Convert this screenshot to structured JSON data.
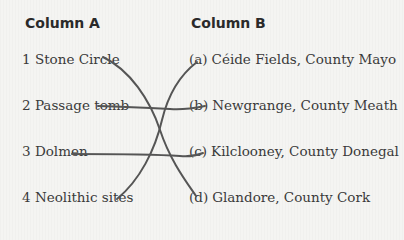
{
  "columns": {
    "a": {
      "heading": "Column A",
      "items": [
        {
          "label": "1 Stone Circle"
        },
        {
          "label": "2 Passage tomb"
        },
        {
          "label": "3 Dolmen"
        },
        {
          "label": "4 Neolithic sites"
        }
      ]
    },
    "b": {
      "heading": "Column B",
      "items": [
        {
          "letter": "(a)",
          "text": "Céide Fields, County Mayo"
        },
        {
          "letter": "(b)",
          "text": "Newgrange, County Meath"
        },
        {
          "letter": "(c)",
          "text": "Kilclooney, County Donegal"
        },
        {
          "letter": "(d)",
          "text": "Glandore, County Cork"
        }
      ]
    }
  },
  "matches": [
    {
      "from": "1 Stone Circle",
      "to": "(d)"
    },
    {
      "from": "2 Passage tomb",
      "to": "(b)"
    },
    {
      "from": "3 Dolmen",
      "to": "(c)"
    },
    {
      "from": "4 Neolithic sites",
      "to": "(a)"
    }
  ],
  "line_color": "#555555"
}
